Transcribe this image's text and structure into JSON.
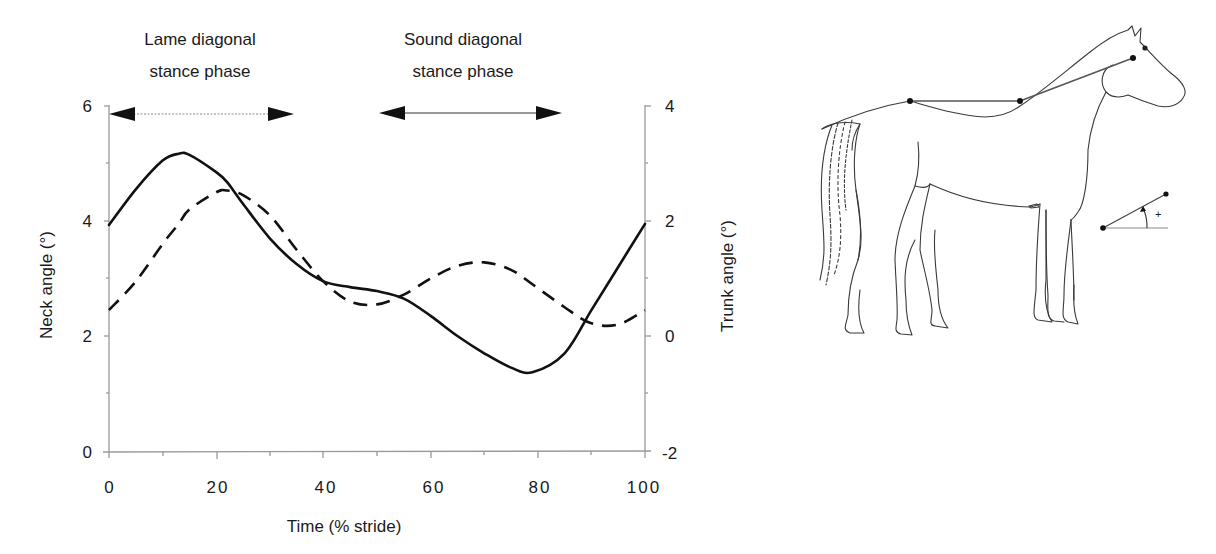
{
  "chart_data": {
    "type": "line",
    "title": "",
    "xlabel": "Time (% stride)",
    "ylabel": "Neck angle (°)",
    "ylabel_right": "Trunk angle (°)",
    "xlim": [
      0,
      100
    ],
    "ylim": [
      0,
      6
    ],
    "ylim_right": [
      -2,
      4
    ],
    "x_ticks": [
      "0",
      "20",
      "40",
      "60",
      "80",
      "100"
    ],
    "y_ticks": [
      "0",
      "2",
      "4",
      "6"
    ],
    "y_ticks_right": [
      "-2",
      "0",
      "2",
      "4"
    ],
    "grid": false,
    "legend": null,
    "annotations": [
      {
        "text": "Lame diagonal stance phase",
        "x_start": 0,
        "x_end": 35,
        "line_style": "dotted"
      },
      {
        "text": "Sound diagonal stance phase",
        "x_start": 50,
        "x_end": 85,
        "line_style": "solid"
      }
    ],
    "x": [
      0,
      5,
      10,
      13,
      15,
      20,
      22,
      25,
      30,
      35,
      40,
      45,
      50,
      55,
      60,
      65,
      70,
      75,
      79,
      85,
      90,
      95,
      100
    ],
    "series": [
      {
        "name": "Neck angle",
        "axis": "left",
        "style": "solid",
        "values": [
          3.93,
          4.55,
          5.05,
          5.17,
          5.15,
          4.85,
          4.68,
          4.3,
          3.7,
          3.25,
          2.95,
          2.85,
          2.78,
          2.65,
          2.35,
          2.0,
          1.7,
          1.45,
          1.37,
          1.7,
          2.45,
          3.2,
          3.95
        ]
      },
      {
        "name": "Trunk angle",
        "axis": "right",
        "style": "dashed",
        "values": [
          0.45,
          0.95,
          1.6,
          1.95,
          2.2,
          2.5,
          2.53,
          2.45,
          2.1,
          1.5,
          0.95,
          0.6,
          0.55,
          0.72,
          1.0,
          1.22,
          1.28,
          1.15,
          0.9,
          0.5,
          0.22,
          0.2,
          0.45
        ]
      }
    ]
  },
  "labels": {
    "lame_line1": "Lame diagonal",
    "lame_line2": "stance phase",
    "sound_line1": "Sound diagonal",
    "sound_line2": "stance phase",
    "xlabel": "Time (% stride)",
    "ylabel_left": "Neck angle (°)",
    "ylabel_right": "Trunk angle (°)",
    "xt": [
      "0",
      "20",
      "40",
      "60",
      "80",
      "100"
    ],
    "yl": [
      "0",
      "2",
      "4",
      "6"
    ],
    "yr": [
      "-2",
      "0",
      "2",
      "4"
    ],
    "angle_sign": "+"
  },
  "colors": {
    "ink": "#1a1a1a",
    "axis": "#9a9a9a",
    "sketch": "#3a3a3a"
  }
}
